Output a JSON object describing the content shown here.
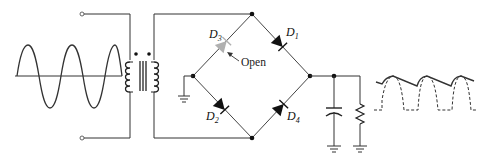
{
  "diagram": {
    "type": "full-wave bridge rectifier with open diode",
    "input_waveform": "sine",
    "input_cycles": 3,
    "components": {
      "transformer": "center-core transformer with dot convention",
      "diodes": [
        {
          "id": "D1",
          "label": "D",
          "sub": "1",
          "state": "normal"
        },
        {
          "id": "D2",
          "label": "D",
          "sub": "2",
          "state": "normal"
        },
        {
          "id": "D3",
          "label": "D",
          "sub": "3",
          "state": "open"
        },
        {
          "id": "D4",
          "label": "D",
          "sub": "4",
          "state": "normal"
        }
      ],
      "capacitor": "filter capacitor",
      "resistor": "load resistor"
    },
    "annotation": {
      "text": "Open",
      "target": "D3"
    },
    "output_waveform": "half-wave rectified (dashed) with capacitor-filtered ripple (solid)",
    "colors": {
      "line": "#222222",
      "open_diode": "#b0b0b0"
    }
  }
}
